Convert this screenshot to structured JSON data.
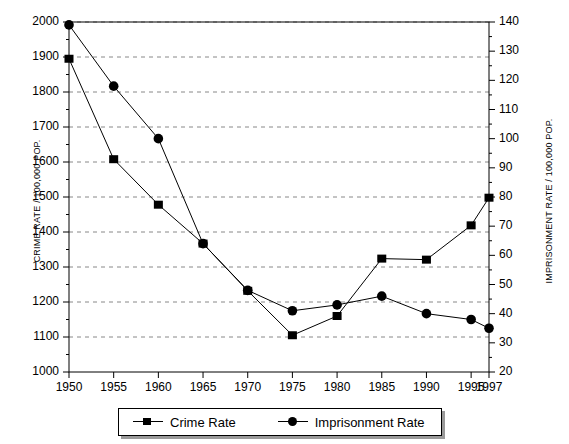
{
  "chart_data": {
    "type": "line",
    "title": "",
    "x": [
      1950,
      1955,
      1960,
      1965,
      1970,
      1975,
      1980,
      1985,
      1990,
      1995,
      1997
    ],
    "xtick_labels": [
      "1950",
      "1955",
      "1960",
      "1965",
      "1970",
      "1975",
      "1980",
      "1985",
      "1990",
      "1995",
      "1997"
    ],
    "xlabel": "",
    "grid": true,
    "legend_position": "bottom",
    "axes": [
      {
        "id": "left",
        "label": "CRIME RATE / 100,000 POP.",
        "lim": [
          1000,
          2000
        ],
        "ticks": [
          1000,
          1100,
          1200,
          1300,
          1400,
          1500,
          1600,
          1700,
          1800,
          1900,
          2000
        ],
        "tick_labels": [
          "1000",
          "1100",
          "1200",
          "1300",
          "1400",
          "1500",
          "1600",
          "1700",
          "1800",
          "1900",
          "2000"
        ]
      },
      {
        "id": "right",
        "label": "IMPRISONMENT RATE / 100,000 POP.",
        "lim": [
          20,
          140
        ],
        "ticks": [
          20,
          30,
          40,
          50,
          60,
          70,
          80,
          90,
          100,
          110,
          120,
          130,
          140
        ],
        "tick_labels": [
          "20",
          "30",
          "40",
          "50",
          "60",
          "70",
          "80",
          "90",
          "100",
          "110",
          "120",
          "130",
          "140"
        ]
      }
    ],
    "series": [
      {
        "name": "Crime Rate",
        "axis": "left",
        "marker": "square",
        "color": "#000000",
        "values": [
          1895,
          1608,
          1478,
          1367,
          1232,
          1105,
          1160,
          1324,
          1321,
          1419,
          1498
        ]
      },
      {
        "name": "Imprisonment Rate",
        "axis": "right",
        "marker": "circle",
        "color": "#000000",
        "values": [
          139,
          118,
          100,
          64,
          48,
          41,
          43,
          46,
          40,
          38,
          35
        ]
      }
    ]
  },
  "legend": {
    "entries": [
      {
        "label": "Crime Rate",
        "marker": "square"
      },
      {
        "label": "Imprisonment Rate",
        "marker": "circle"
      }
    ]
  }
}
